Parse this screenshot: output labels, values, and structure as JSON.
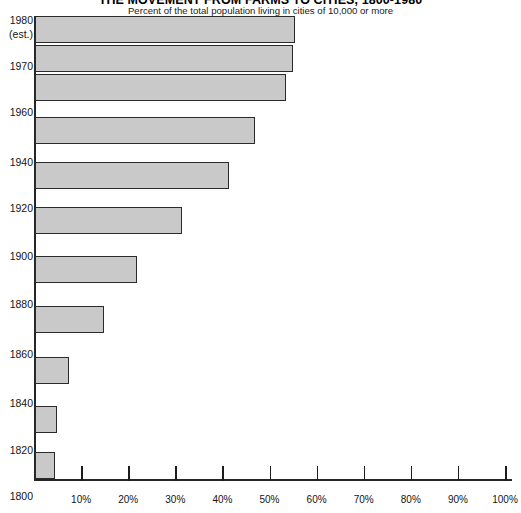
{
  "header": {
    "title": "THE MOVEMENT FROM FARMS TO CITIES, 1800-1980",
    "subtitle": "Percent of the total population living in cities of 10,000 or more"
  },
  "chart_data": {
    "type": "bar",
    "orientation": "horizontal",
    "title": "THE MOVEMENT FROM FARMS TO CITIES, 1800-1980",
    "subtitle": "Percent of the total population living in cities of 10,000 or more",
    "xlabel": "",
    "ylabel": "",
    "xlim": [
      0,
      100
    ],
    "grid": false,
    "legend": null,
    "xtick_labels": [
      "10%",
      "20%",
      "30%",
      "40%",
      "50%",
      "60%",
      "70%",
      "80%",
      "90%",
      "100%"
    ],
    "xtick_values": [
      10,
      20,
      30,
      40,
      50,
      60,
      70,
      80,
      90,
      100
    ],
    "categories": [
      "1980",
      "1970",
      "1960",
      "1940",
      "1920",
      "1900",
      "1880",
      "1860",
      "1840",
      "1820",
      "1800"
    ],
    "category_annotations": {
      "1980": "(est.)"
    },
    "values": [
      55,
      54.5,
      53,
      46.5,
      41,
      31,
      21.5,
      14.5,
      7,
      4.5,
      4
    ],
    "bars": [
      {
        "label": "1980",
        "sublabel": "(est.)",
        "value": 55
      },
      {
        "label": "1970",
        "sublabel": "",
        "value": 54.5
      },
      {
        "label": "1960",
        "sublabel": "",
        "value": 53
      },
      {
        "label": "1940",
        "sublabel": "",
        "value": 46.5
      },
      {
        "label": "1920",
        "sublabel": "",
        "value": 41
      },
      {
        "label": "1900",
        "sublabel": "",
        "value": 31
      },
      {
        "label": "1880",
        "sublabel": "",
        "value": 21.5
      },
      {
        "label": "1860",
        "sublabel": "",
        "value": 14.5
      },
      {
        "label": "1840",
        "sublabel": "",
        "value": 7
      },
      {
        "label": "1820",
        "sublabel": "",
        "value": 4.5
      },
      {
        "label": "1800",
        "sublabel": "",
        "value": 4
      }
    ],
    "colors": {
      "bar_fill": "#c9c9c9",
      "bar_stroke": "#2b2b2b",
      "axis": "#262626",
      "text": "#141414",
      "background": "#ffffff"
    }
  },
  "geometry": {
    "axis_x0": 34,
    "axis_y_top": 16,
    "baseline_y": 479,
    "px_per_percent": 4.71,
    "bar_rows": [
      {
        "top": 16,
        "height": 27
      },
      {
        "top": 45,
        "height": 27
      },
      {
        "top": 74,
        "height": 27
      },
      {
        "top": 117,
        "height": 27
      },
      {
        "top": 162,
        "height": 27
      },
      {
        "top": 207,
        "height": 27
      },
      {
        "top": 256,
        "height": 27
      },
      {
        "top": 306,
        "height": 27
      },
      {
        "top": 357,
        "height": 27
      },
      {
        "top": 406,
        "height": 27
      },
      {
        "top": 452,
        "height": 27
      }
    ],
    "ylabel_tops": [
      14,
      60,
      106,
      156,
      202,
      250,
      298,
      348,
      397,
      444
    ],
    "ylabel_texts": [
      "1980",
      "1970",
      "1960",
      "1940",
      "1920",
      "1900",
      "1880",
      "1860",
      "1840",
      "1820"
    ],
    "ylabel_last": {
      "text": "1800",
      "top": 490
    }
  }
}
